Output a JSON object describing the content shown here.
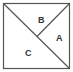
{
  "diagram": {
    "shape": "square",
    "colors": {
      "stroke": "#555555",
      "label": "#333333",
      "background": "#ffffff"
    },
    "regions": [
      {
        "id": "A",
        "label": "A"
      },
      {
        "id": "B",
        "label": "B"
      },
      {
        "id": "C",
        "label": "C"
      }
    ]
  }
}
